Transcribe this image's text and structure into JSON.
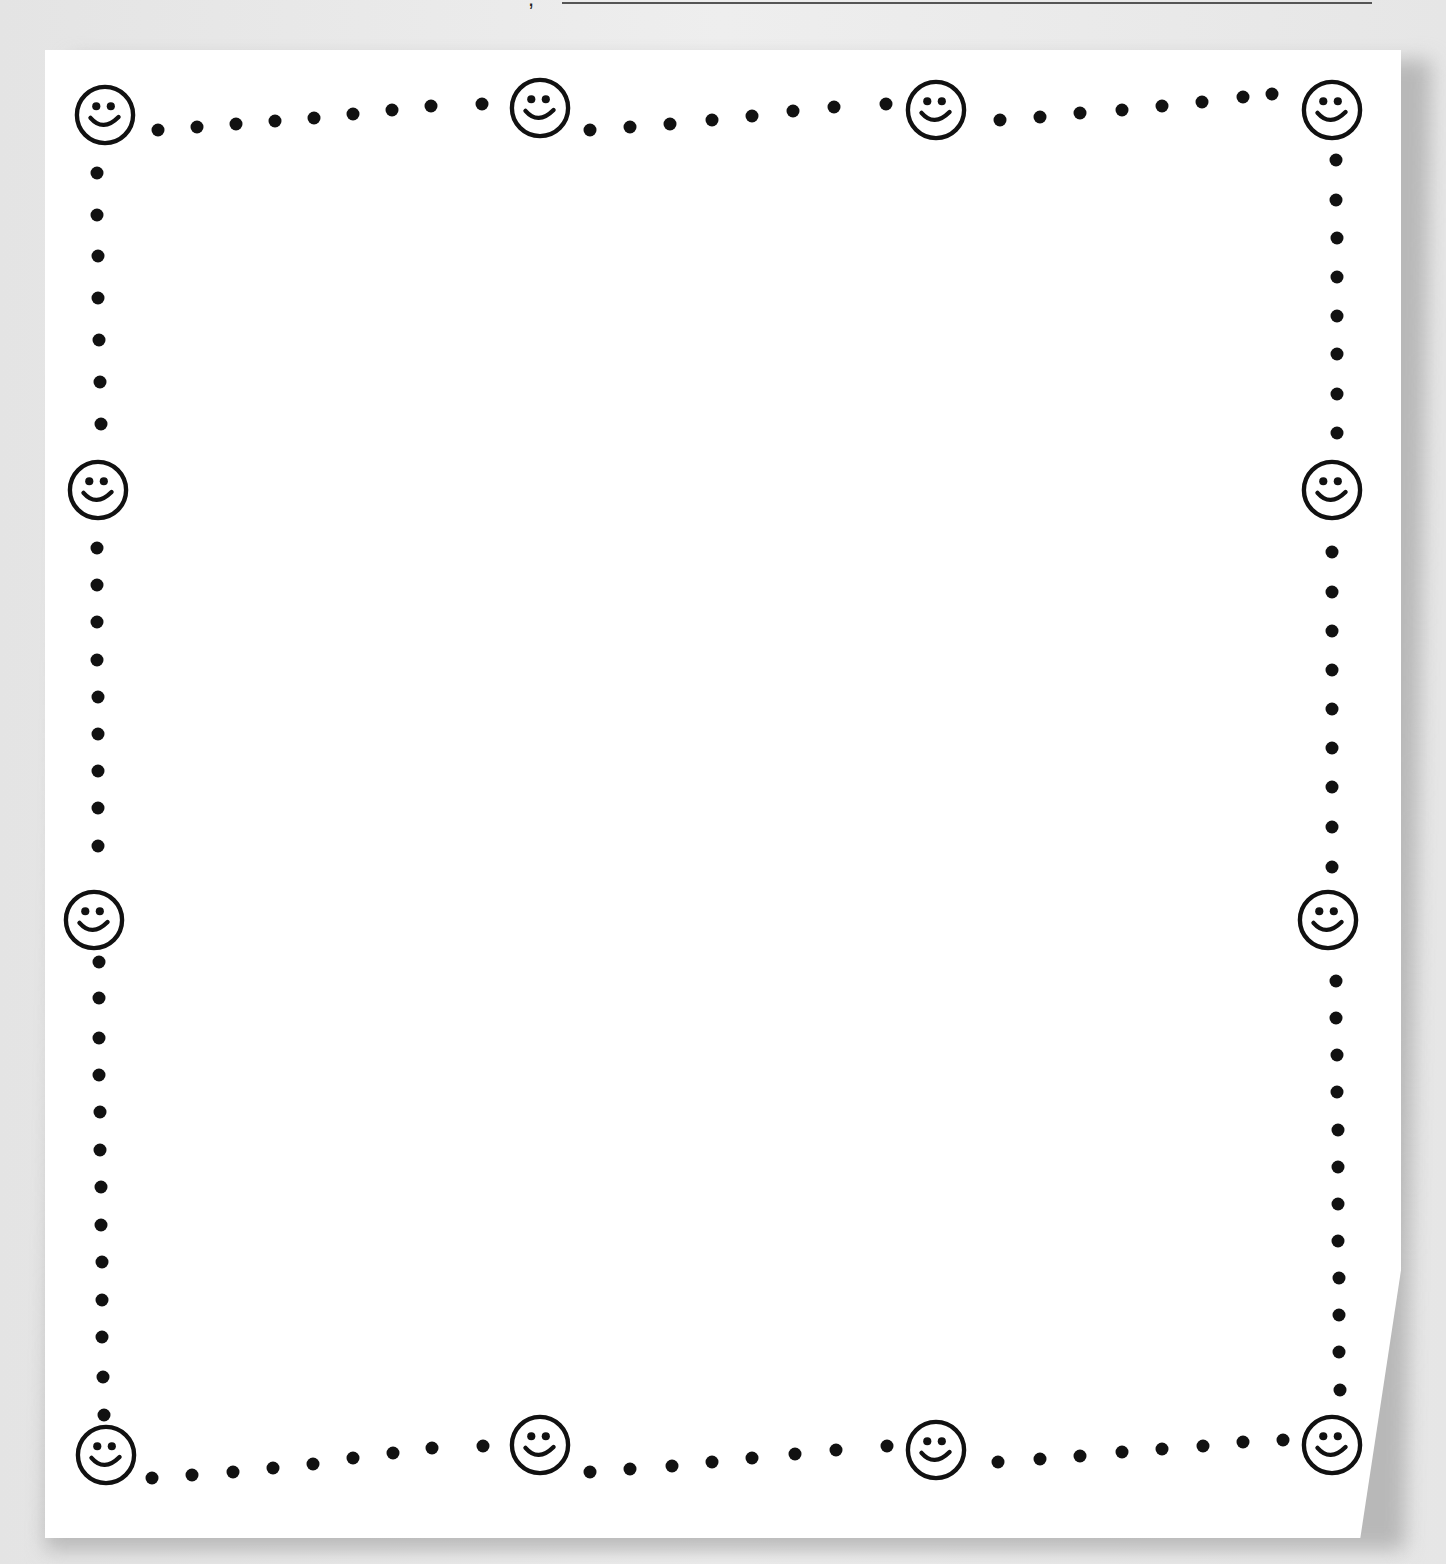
{
  "header": {
    "name_prefix": ",",
    "name_line": ""
  },
  "border": {
    "style": "dotted-smiley-frame",
    "icon": "smiley-face-icon",
    "dot_color": "#111111",
    "page_color": "#ffffff",
    "background_color": "#e8e8e8",
    "smileys": [
      {
        "x": 105,
        "y": 115
      },
      {
        "x": 540,
        "y": 108
      },
      {
        "x": 936,
        "y": 110
      },
      {
        "x": 1332,
        "y": 110
      },
      {
        "x": 98,
        "y": 490
      },
      {
        "x": 1332,
        "y": 490
      },
      {
        "x": 94,
        "y": 920
      },
      {
        "x": 1328,
        "y": 920
      },
      {
        "x": 106,
        "y": 1455
      },
      {
        "x": 540,
        "y": 1445
      },
      {
        "x": 936,
        "y": 1450
      },
      {
        "x": 1332,
        "y": 1445
      }
    ],
    "dots": [
      [
        158,
        130
      ],
      [
        197,
        127
      ],
      [
        236,
        124
      ],
      [
        275,
        121
      ],
      [
        314,
        118
      ],
      [
        353,
        114
      ],
      [
        392,
        110
      ],
      [
        431,
        106
      ],
      [
        482,
        104
      ],
      [
        590,
        130
      ],
      [
        630,
        127
      ],
      [
        670,
        124
      ],
      [
        712,
        120
      ],
      [
        752,
        116
      ],
      [
        793,
        111
      ],
      [
        834,
        107
      ],
      [
        886,
        104
      ],
      [
        1000,
        120
      ],
      [
        1040,
        117
      ],
      [
        1080,
        113
      ],
      [
        1122,
        110
      ],
      [
        1162,
        106
      ],
      [
        1202,
        102
      ],
      [
        1243,
        97
      ],
      [
        1272,
        94
      ],
      [
        152,
        1478
      ],
      [
        192,
        1475
      ],
      [
        233,
        1472
      ],
      [
        273,
        1468
      ],
      [
        313,
        1464
      ],
      [
        353,
        1458
      ],
      [
        393,
        1453
      ],
      [
        432,
        1448
      ],
      [
        483,
        1446
      ],
      [
        590,
        1472
      ],
      [
        630,
        1469
      ],
      [
        672,
        1466
      ],
      [
        712,
        1462
      ],
      [
        752,
        1458
      ],
      [
        795,
        1454
      ],
      [
        836,
        1450
      ],
      [
        887,
        1446
      ],
      [
        998,
        1462
      ],
      [
        1040,
        1459
      ],
      [
        1080,
        1456
      ],
      [
        1122,
        1452
      ],
      [
        1162,
        1449
      ],
      [
        1203,
        1446
      ],
      [
        1243,
        1442
      ],
      [
        1283,
        1440
      ],
      [
        97,
        173
      ],
      [
        97,
        215
      ],
      [
        98,
        256
      ],
      [
        98,
        298
      ],
      [
        99,
        340
      ],
      [
        100,
        382
      ],
      [
        101,
        424
      ],
      [
        97,
        548
      ],
      [
        97,
        585
      ],
      [
        97,
        622
      ],
      [
        97,
        660
      ],
      [
        98,
        697
      ],
      [
        98,
        734
      ],
      [
        98,
        771
      ],
      [
        98,
        808
      ],
      [
        98,
        846
      ],
      [
        99,
        962
      ],
      [
        99,
        998
      ],
      [
        99,
        1038
      ],
      [
        99,
        1075
      ],
      [
        100,
        1112
      ],
      [
        100,
        1150
      ],
      [
        101,
        1187
      ],
      [
        101,
        1225
      ],
      [
        102,
        1262
      ],
      [
        102,
        1300
      ],
      [
        102,
        1337
      ],
      [
        103,
        1377
      ],
      [
        104,
        1415
      ],
      [
        1336,
        160
      ],
      [
        1336,
        200
      ],
      [
        1337,
        238
      ],
      [
        1337,
        277
      ],
      [
        1337,
        316
      ],
      [
        1337,
        354
      ],
      [
        1337,
        394
      ],
      [
        1337,
        433
      ],
      [
        1332,
        552
      ],
      [
        1332,
        592
      ],
      [
        1332,
        631
      ],
      [
        1332,
        670
      ],
      [
        1332,
        709
      ],
      [
        1332,
        748
      ],
      [
        1332,
        787
      ],
      [
        1332,
        827
      ],
      [
        1332,
        867
      ],
      [
        1336,
        981
      ],
      [
        1336,
        1018
      ],
      [
        1337,
        1055
      ],
      [
        1337,
        1092
      ],
      [
        1338,
        1130
      ],
      [
        1338,
        1167
      ],
      [
        1338,
        1204
      ],
      [
        1338,
        1241
      ],
      [
        1339,
        1278
      ],
      [
        1339,
        1315
      ],
      [
        1339,
        1352
      ],
      [
        1340,
        1390
      ]
    ]
  }
}
